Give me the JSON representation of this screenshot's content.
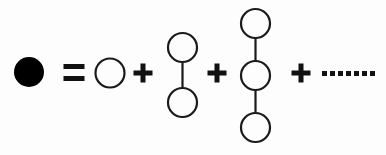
{
  "figure": {
    "background_color": "#fdfdfd",
    "stroke_color": "#1a1a1a",
    "fill_color": "#000000",
    "width": 386,
    "height": 155
  },
  "equation": {
    "left_side": {
      "label": "filled-circle",
      "description": "solid black disc",
      "cx": 29,
      "cy": 72,
      "r": 15,
      "filled": true
    },
    "relation": {
      "symbol": "=",
      "x": 74,
      "y": 73
    },
    "terms": [
      {
        "name": "monomer",
        "node_count": 1,
        "nodes": [
          {
            "cx": 110,
            "cy": 73,
            "r": 14.5
          }
        ],
        "bonds": []
      },
      {
        "name": "dimer",
        "node_count": 2,
        "nodes": [
          {
            "cx": 182.5,
            "cy": 47.5,
            "r": 14.5
          },
          {
            "cx": 182.5,
            "cy": 102.5,
            "r": 14.5
          }
        ],
        "bonds": [
          {
            "x1": 182.5,
            "y1": 62,
            "x2": 182.5,
            "y2": 88
          }
        ]
      },
      {
        "name": "trimer",
        "node_count": 3,
        "nodes": [
          {
            "cx": 255.5,
            "cy": 23.5,
            "r": 14.5
          },
          {
            "cx": 255.5,
            "cy": 75.5,
            "r": 14.5
          },
          {
            "cx": 255.5,
            "cy": 127.5,
            "r": 14.5
          }
        ],
        "bonds": [
          {
            "x1": 255.5,
            "y1": 38,
            "x2": 255.5,
            "y2": 61
          },
          {
            "x1": 255.5,
            "y1": 90,
            "x2": 255.5,
            "y2": 113
          }
        ]
      }
    ],
    "operators": [
      {
        "symbol": "+",
        "x": 143,
        "y": 73
      },
      {
        "symbol": "+",
        "x": 217,
        "y": 73
      },
      {
        "symbol": "+",
        "x": 301,
        "y": 73
      }
    ],
    "continuation": {
      "name": "ellipsis",
      "dot_count": 7,
      "dot_size": 5,
      "start_x": 322,
      "y": 71,
      "spacing": 8
    }
  }
}
